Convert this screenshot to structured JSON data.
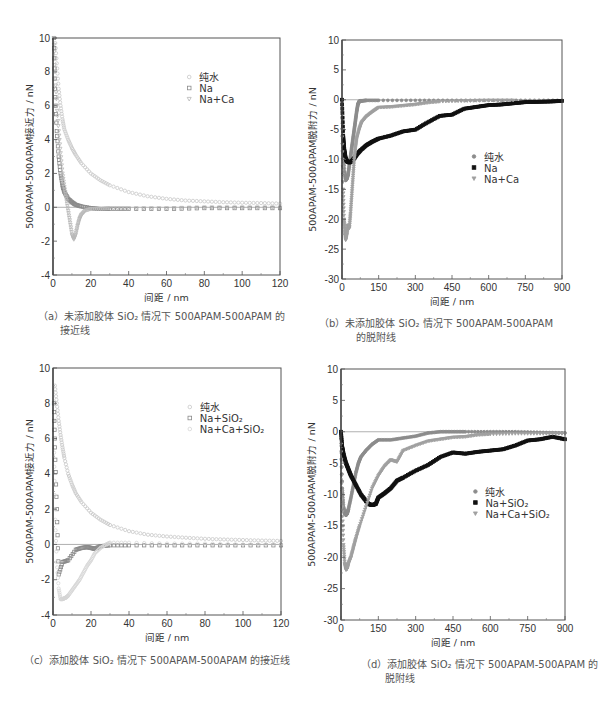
{
  "chart_data": [
    {
      "id": "a",
      "type": "scatter",
      "title": "",
      "caption_line1": "（a）未添加胶体 SiO₂ 情况下 500APAM-500APAM 的",
      "caption_line2": "接近线",
      "xlabel": "间距 / nm",
      "ylabel": "500APAM-500APAM接近力 / nN",
      "xlim": [
        0,
        120
      ],
      "ylim": [
        -4,
        10
      ],
      "xticks": [
        0,
        20,
        40,
        60,
        80,
        100,
        120
      ],
      "yticks": [
        -4,
        -2,
        0,
        2,
        4,
        6,
        8,
        10
      ],
      "grid": false,
      "zero_line": true,
      "legend_position": "upper right",
      "series": [
        {
          "name": "纯水",
          "marker": "circle-open",
          "color": "#c8c8c8",
          "x": [
            1,
            2,
            3,
            4,
            5,
            6,
            8,
            10,
            12,
            15,
            20,
            25,
            30,
            40,
            50,
            60,
            70,
            80,
            90,
            100,
            110,
            120
          ],
          "y": [
            10,
            8.5,
            7,
            6,
            5.2,
            4.6,
            4.0,
            3.5,
            3.1,
            2.6,
            2.0,
            1.6,
            1.3,
            0.9,
            0.65,
            0.5,
            0.4,
            0.35,
            0.3,
            0.27,
            0.25,
            0.22
          ]
        },
        {
          "name": "Na",
          "marker": "square-open",
          "color": "#8a8a8a",
          "x": [
            0.5,
            1,
            2,
            3,
            4,
            5,
            6,
            8,
            10,
            12,
            15,
            20,
            25,
            30,
            40,
            60,
            80,
            100,
            120
          ],
          "y": [
            10,
            7,
            4.5,
            3,
            2,
            1.3,
            0.9,
            0.5,
            0.3,
            0.15,
            0.05,
            -0.05,
            -0.1,
            -0.1,
            -0.1,
            -0.1,
            -0.05,
            -0.05,
            -0.05
          ]
        },
        {
          "name": "Na+Ca",
          "marker": "triangle-down-open",
          "color": "#b8b8b8",
          "x": [
            0.5,
            1,
            2,
            3,
            4,
            5,
            6,
            7,
            8,
            9,
            10,
            11,
            12,
            13,
            14,
            15,
            17,
            20,
            25,
            30,
            40,
            60,
            80,
            100,
            120
          ],
          "y": [
            10,
            8,
            6,
            4.5,
            3.2,
            2,
            1.2,
            0.5,
            -0.2,
            -0.9,
            -1.6,
            -1.9,
            -1.6,
            -1.1,
            -0.7,
            -0.45,
            -0.2,
            -0.1,
            -0.1,
            -0.05,
            -0.05,
            -0.05,
            0,
            0,
            0
          ]
        }
      ]
    },
    {
      "id": "b",
      "type": "scatter",
      "title": "",
      "caption_line1": "（b）未添加胶体 SiO₂ 情况下 500APAM-500APAM",
      "caption_line2": "的脱附线",
      "xlabel": "间距 / nm",
      "ylabel": "500APAM-500APAM脱附力 / nN",
      "xlim": [
        0,
        900
      ],
      "ylim": [
        -30,
        10
      ],
      "xticks": [
        0,
        150,
        300,
        450,
        600,
        750,
        900
      ],
      "yticks": [
        -30,
        -25,
        -20,
        -15,
        -10,
        -5,
        0,
        5,
        10
      ],
      "grid": false,
      "zero_line": true,
      "legend_position": "center right",
      "series": [
        {
          "name": "纯水",
          "marker": "circle-filled",
          "color": "#8c8c8c",
          "x": [
            0,
            5,
            10,
            15,
            20,
            25,
            30,
            35,
            40,
            45,
            50,
            55,
            60,
            65,
            70,
            75,
            80,
            100,
            150,
            300,
            450,
            600,
            750,
            900
          ],
          "y": [
            0,
            -8,
            -12,
            -13.5,
            -13.2,
            -12.5,
            -11,
            -9.5,
            -8,
            -6.5,
            -5,
            -3.5,
            -2,
            -0.8,
            -0.3,
            -0.2,
            -0.2,
            -0.1,
            -0.1,
            -0.1,
            -0.1,
            -0.1,
            -0.1,
            -0.1
          ]
        },
        {
          "name": "Na",
          "marker": "square-filled",
          "color": "#111111",
          "x": [
            0,
            5,
            10,
            15,
            20,
            30,
            40,
            50,
            60,
            75,
            100,
            125,
            150,
            200,
            250,
            300,
            350,
            400,
            450,
            500,
            550,
            600,
            650,
            700,
            750,
            800,
            850,
            900
          ],
          "y": [
            0,
            -6,
            -8.5,
            -9.8,
            -10.3,
            -10.5,
            -10.3,
            -9.8,
            -9.2,
            -8.5,
            -7.6,
            -7,
            -6.5,
            -6,
            -5.3,
            -5,
            -3.8,
            -2.7,
            -2.5,
            -1.5,
            -1.2,
            -0.9,
            -0.8,
            -0.6,
            -0.4,
            -0.35,
            -0.3,
            -0.2
          ]
        },
        {
          "name": "Na+Ca",
          "marker": "triangle-down-filled",
          "color": "#a0a0a0",
          "x": [
            0,
            5,
            8,
            12,
            15,
            20,
            25,
            30,
            35,
            40,
            45,
            50,
            55,
            60,
            70,
            80,
            100,
            125,
            150,
            200,
            250,
            300,
            350,
            400,
            500,
            600,
            700
          ],
          "y": [
            -5,
            -15,
            -20,
            -22,
            -23.5,
            -22.5,
            -21,
            -21.5,
            -19,
            -16,
            -13,
            -10,
            -8,
            -6.5,
            -5,
            -3.8,
            -2.8,
            -2,
            -1.3,
            -1.2,
            -1,
            -0.8,
            -0.5,
            -0.3,
            -0.2,
            -0.1,
            -0.1
          ]
        }
      ]
    },
    {
      "id": "c",
      "type": "scatter",
      "title": "",
      "caption_line1": "（c）添加胶体 SiO₂ 情况下 500APAM-500APAM 的接近线",
      "caption_line2": "",
      "xlabel": "间距 / nm",
      "ylabel": "500APAM-500APAM接近力 / nN",
      "xlim": [
        0,
        120
      ],
      "ylim": [
        -4,
        10
      ],
      "xticks": [
        0,
        20,
        40,
        60,
        80,
        100,
        120
      ],
      "yticks": [
        -4,
        -2,
        0,
        2,
        4,
        6,
        8,
        10
      ],
      "grid": false,
      "zero_line": true,
      "legend_position": "upper right",
      "series": [
        {
          "name": "纯水",
          "marker": "circle-open",
          "color": "#c8c8c8",
          "x": [
            1,
            2,
            3,
            4,
            5,
            6,
            8,
            10,
            12,
            15,
            20,
            25,
            30,
            40,
            50,
            60,
            70,
            80,
            90,
            100,
            110,
            120
          ],
          "y": [
            9,
            8,
            7,
            6.2,
            5.5,
            4.9,
            4.0,
            3.4,
            2.9,
            2.4,
            1.8,
            1.4,
            1.1,
            0.75,
            0.55,
            0.45,
            0.38,
            0.32,
            0.28,
            0.25,
            0.22,
            0.2
          ]
        },
        {
          "name": "Na+SiO₂",
          "marker": "square-open",
          "color": "#8a8a8a",
          "x": [
            0.5,
            1,
            2,
            3,
            5,
            8,
            12,
            15,
            18,
            20,
            22,
            25,
            30,
            40,
            60,
            80,
            100,
            120
          ],
          "y": [
            8,
            5.5,
            2,
            -1.7,
            -1,
            -0.9,
            -0.3,
            -0.2,
            -0.15,
            -0.2,
            -0.25,
            -0.1,
            -0.05,
            -0.05,
            -0.05,
            -0.05,
            -0.05,
            -0.05
          ]
        },
        {
          "name": "Na+Ca+SiO₂",
          "marker": "circle-open",
          "color": "#d6d6d6",
          "x": [
            0.5,
            1,
            2,
            3,
            4,
            5,
            6,
            7,
            8,
            10,
            12,
            14,
            16,
            18,
            20,
            22,
            25,
            28,
            30,
            40,
            60,
            80,
            100,
            120
          ],
          "y": [
            6,
            2,
            -1,
            -2.5,
            -3.1,
            -3.1,
            -3.05,
            -3,
            -2.9,
            -2.6,
            -2.3,
            -2,
            -1.6,
            -1.2,
            -0.9,
            -0.5,
            -0.2,
            0,
            0.1,
            0.1,
            0.05,
            0.05,
            0,
            0
          ]
        }
      ]
    },
    {
      "id": "d",
      "type": "scatter",
      "title": "",
      "caption_line1": "（d）添加胶体 SiO₂ 情况下 500APAM-500APAM 的",
      "caption_line2": "脱附线",
      "xlabel": "间距 / nm",
      "ylabel": "500APAM-500APAM脱附力 / nN",
      "xlim": [
        0,
        900
      ],
      "ylim": [
        -30,
        10
      ],
      "xticks": [
        0,
        150,
        300,
        450,
        600,
        750,
        900
      ],
      "yticks": [
        -30,
        -25,
        -20,
        -15,
        -10,
        -5,
        0,
        5,
        10
      ],
      "grid": false,
      "zero_line": true,
      "legend_position": "center right",
      "series": [
        {
          "name": "纯水",
          "marker": "circle-filled",
          "color": "#8c8c8c",
          "x": [
            0,
            5,
            10,
            15,
            20,
            25,
            30,
            40,
            50,
            60,
            70,
            80,
            100,
            125,
            150,
            200,
            250,
            300,
            350,
            400,
            450,
            500,
            600,
            700,
            800,
            900
          ],
          "y": [
            0,
            -9,
            -12,
            -13,
            -13.3,
            -13,
            -12.3,
            -10.5,
            -8.5,
            -6.5,
            -5,
            -4,
            -3,
            -2,
            -1.3,
            -1.3,
            -1,
            -0.7,
            -0.2,
            0,
            0,
            0,
            0,
            0,
            -0.1,
            -0.2
          ]
        },
        {
          "name": "Na+SiO₂",
          "marker": "square-filled",
          "color": "#111111",
          "x": [
            0,
            5,
            10,
            20,
            30,
            40,
            60,
            80,
            100,
            110,
            125,
            140,
            150,
            175,
            200,
            225,
            250,
            300,
            350,
            400,
            450,
            500,
            550,
            600,
            650,
            700,
            750,
            800,
            850,
            900
          ],
          "y": [
            0,
            -2.5,
            -3.5,
            -5,
            -6,
            -7,
            -8.5,
            -10,
            -11,
            -11.5,
            -11.7,
            -11.5,
            -10.5,
            -9.8,
            -9,
            -7.8,
            -7.3,
            -6.2,
            -5.3,
            -4,
            -3.3,
            -3.5,
            -3.2,
            -3,
            -2.8,
            -2.2,
            -1.4,
            -1.2,
            -0.8,
            -1.2
          ]
        },
        {
          "name": "Na+Ca+SiO₂",
          "marker": "triangle-down-filled",
          "color": "#a0a0a0",
          "x": [
            0,
            5,
            10,
            15,
            20,
            25,
            30,
            40,
            50,
            60,
            75,
            100,
            125,
            150,
            175,
            200,
            225,
            250,
            300,
            350,
            400,
            450,
            500,
            550,
            600,
            700,
            800,
            900
          ],
          "y": [
            -2,
            -12,
            -18,
            -21,
            -22,
            -21.8,
            -21,
            -20,
            -18.5,
            -17,
            -15,
            -12,
            -9,
            -7,
            -5.5,
            -4.5,
            -4.8,
            -3,
            -2.2,
            -1.5,
            -1.2,
            -0.9,
            -0.8,
            -0.5,
            -0.4,
            -0.3,
            -0.3,
            -0.3
          ]
        }
      ]
    }
  ]
}
